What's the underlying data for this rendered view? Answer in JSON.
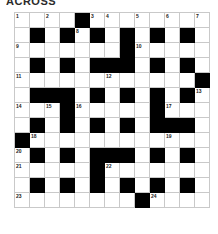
{
  "header": {
    "title": "ACROSS"
  },
  "grid": {
    "columns": 13,
    "rows": 13,
    "cell_size_px": 15,
    "colors": {
      "block": "#000000",
      "empty": "#ffffff",
      "gridline": "#c9c9c9",
      "number_text": "#1a1a1a"
    },
    "legend": {
      "block_code": 1,
      "open_code": 0
    },
    "blocks": [
      [
        0,
        0,
        0,
        0,
        1,
        0,
        0,
        0,
        0,
        0,
        0,
        0,
        0
      ],
      [
        0,
        1,
        0,
        1,
        0,
        1,
        0,
        1,
        0,
        1,
        0,
        1,
        0
      ],
      [
        0,
        0,
        0,
        0,
        0,
        0,
        0,
        1,
        0,
        0,
        0,
        0,
        0
      ],
      [
        0,
        1,
        0,
        1,
        0,
        1,
        1,
        1,
        0,
        1,
        0,
        1,
        0
      ],
      [
        0,
        0,
        0,
        0,
        0,
        0,
        0,
        0,
        0,
        0,
        0,
        0,
        1
      ],
      [
        0,
        1,
        1,
        1,
        0,
        1,
        0,
        1,
        0,
        1,
        0,
        1,
        0
      ],
      [
        0,
        0,
        0,
        1,
        0,
        0,
        0,
        0,
        0,
        1,
        0,
        0,
        0
      ],
      [
        0,
        1,
        0,
        1,
        0,
        1,
        0,
        1,
        0,
        1,
        1,
        1,
        0
      ],
      [
        1,
        0,
        0,
        0,
        0,
        0,
        0,
        0,
        0,
        0,
        0,
        0,
        0
      ],
      [
        0,
        1,
        0,
        1,
        0,
        1,
        1,
        1,
        0,
        1,
        0,
        1,
        0
      ],
      [
        0,
        0,
        0,
        0,
        0,
        1,
        0,
        0,
        0,
        0,
        0,
        0,
        0
      ],
      [
        0,
        1,
        0,
        1,
        0,
        1,
        0,
        1,
        0,
        1,
        0,
        1,
        0
      ],
      [
        0,
        0,
        0,
        0,
        0,
        0,
        0,
        0,
        1,
        0,
        0,
        0,
        0
      ]
    ],
    "numbers": [
      {
        "row": 0,
        "col": 0,
        "label": "1"
      },
      {
        "row": 0,
        "col": 2,
        "label": "2"
      },
      {
        "row": 0,
        "col": 5,
        "label": "3"
      },
      {
        "row": 0,
        "col": 6,
        "label": "4"
      },
      {
        "row": 0,
        "col": 8,
        "label": "5"
      },
      {
        "row": 0,
        "col": 10,
        "label": "6"
      },
      {
        "row": 0,
        "col": 12,
        "label": "7"
      },
      {
        "row": 1,
        "col": 4,
        "label": "8"
      },
      {
        "row": 2,
        "col": 0,
        "label": "9"
      },
      {
        "row": 2,
        "col": 8,
        "label": "10"
      },
      {
        "row": 4,
        "col": 0,
        "label": "11"
      },
      {
        "row": 4,
        "col": 6,
        "label": "12"
      },
      {
        "row": 5,
        "col": 12,
        "label": "13"
      },
      {
        "row": 6,
        "col": 0,
        "label": "14"
      },
      {
        "row": 6,
        "col": 2,
        "label": "15"
      },
      {
        "row": 6,
        "col": 4,
        "label": "16"
      },
      {
        "row": 6,
        "col": 10,
        "label": "17"
      },
      {
        "row": 8,
        "col": 1,
        "label": "18"
      },
      {
        "row": 8,
        "col": 10,
        "label": "19"
      },
      {
        "row": 9,
        "col": 0,
        "label": "20"
      },
      {
        "row": 10,
        "col": 0,
        "label": "21"
      },
      {
        "row": 10,
        "col": 6,
        "label": "22"
      },
      {
        "row": 12,
        "col": 0,
        "label": "23"
      },
      {
        "row": 12,
        "col": 9,
        "label": "24"
      }
    ]
  }
}
